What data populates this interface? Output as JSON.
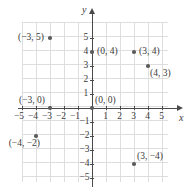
{
  "chart_data": {
    "type": "scatter",
    "title": "",
    "xlabel": "x",
    "ylabel": "y",
    "xlim": [
      -5.5,
      5.8
    ],
    "ylim": [
      -5.7,
      5.9
    ],
    "grid": true,
    "grid_step": 1,
    "legend": "none",
    "x_ticks": [
      "-5",
      "-4",
      "-3",
      "-2",
      "-1",
      "1",
      "2",
      "3",
      "4",
      "5"
    ],
    "y_ticks": [
      "5",
      "4",
      "3",
      "2",
      "1",
      "-1",
      "-2",
      "-3",
      "-4",
      "-5"
    ],
    "points": [
      {
        "x": -3,
        "y": 5,
        "label": "(−3, 5)",
        "label_pos": "left"
      },
      {
        "x": 0,
        "y": 4,
        "label": "(0, 4)",
        "label_pos": "right"
      },
      {
        "x": 3,
        "y": 4,
        "label": "(3, 4)",
        "label_pos": "right"
      },
      {
        "x": 4,
        "y": 3,
        "label": "(4, 3)",
        "label_pos": "below-right"
      },
      {
        "x": -3,
        "y": 0,
        "label": "(−3, 0)",
        "label_pos": "above-left"
      },
      {
        "x": 0,
        "y": 0,
        "label": "(0, 0)",
        "label_pos": "above-right"
      },
      {
        "x": -4,
        "y": -2,
        "label": "(−4, −2)",
        "label_pos": "below-left"
      },
      {
        "x": 3,
        "y": -4,
        "label": "(3, −4)",
        "label_pos": "above-right"
      }
    ],
    "colors": {
      "grid": "#dedede",
      "axis": "#4a4a4a",
      "point": "#5c5c5c",
      "text": "#3b3b3b",
      "background": "#ffffff"
    }
  }
}
